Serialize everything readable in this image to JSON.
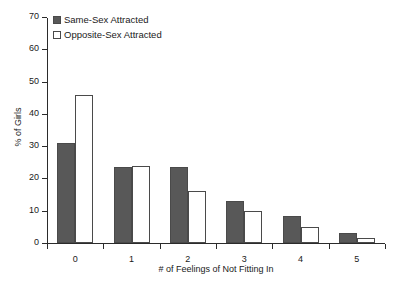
{
  "chart_data": {
    "type": "bar",
    "title": "",
    "xlabel": "# of Feelings of Not Fitting In",
    "ylabel": "% of Girls",
    "categories": [
      "0",
      "1",
      "2",
      "3",
      "4",
      "5"
    ],
    "series": [
      {
        "name": "Same-Sex Attracted",
        "color": "#585858",
        "values": [
          31,
          23.5,
          23.5,
          13,
          8.5,
          3
        ]
      },
      {
        "name": "Opposite-Sex Attracted",
        "color": "#ffffff",
        "values": [
          46,
          24,
          16,
          10,
          5,
          1.5
        ]
      }
    ],
    "ylim": [
      0,
      70
    ],
    "yticks": [
      0,
      10,
      20,
      30,
      40,
      50,
      60,
      70
    ],
    "ytick_labels": [
      "0",
      "10",
      "20",
      "30",
      "40",
      "50",
      "60",
      "70"
    ],
    "grid": false,
    "legend_position": "top-left"
  },
  "legend": {
    "items": [
      {
        "label": "Same-Sex Attracted",
        "swatch": "filled-dark-square"
      },
      {
        "label": "Opposite-Sex Attracted",
        "swatch": "open-white-square"
      }
    ]
  },
  "axes": {
    "y_title": "% of Girls",
    "x_title": "# of Feelings of Not Fitting In"
  },
  "colors": {
    "bar_dark": "#585858",
    "bar_light": "#ffffff",
    "bar_stroke": "#4a4a4a",
    "axis": "#2b2b2b",
    "text": "#1a1a1a",
    "background": "#ffffff"
  }
}
